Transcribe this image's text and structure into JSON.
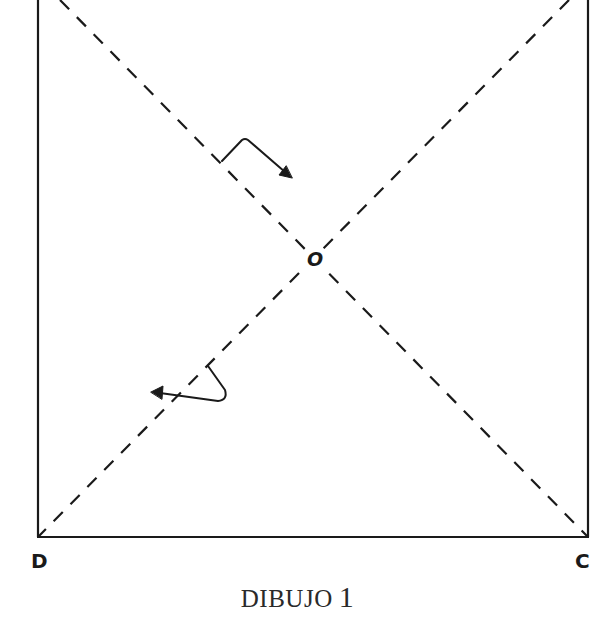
{
  "figure": {
    "caption_text": "DIBUJO",
    "caption_number": "1",
    "vertices": {
      "bottom_left": "D",
      "bottom_right": "C",
      "center": "O"
    },
    "elements": [
      "square-outline (top edge cropped)",
      "dashed-diagonal-top-left-to-bottom-right",
      "dashed-diagonal-top-right-to-bottom-left",
      "fold-arrow-upper (points down-right along diagonal)",
      "fold-arrow-lower (points left, across diagonal)"
    ],
    "colors": {
      "line": "#1a1a1a",
      "background": "#ffffff"
    }
  }
}
